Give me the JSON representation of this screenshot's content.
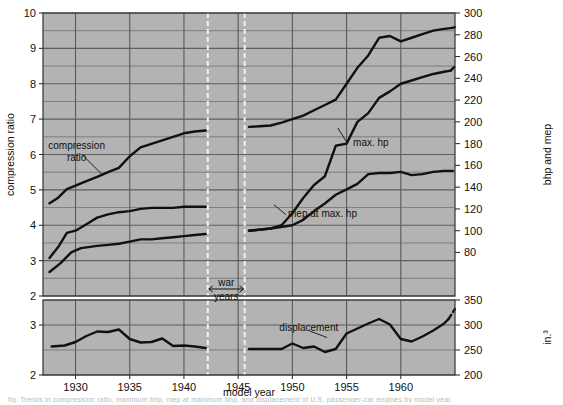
{
  "figure": {
    "background": "#ffffff",
    "panel_fill": "#b3b3b3",
    "grid_color": "#5a5a5a",
    "curve_color": "#111111",
    "war_marker_color": "#f2f2f2",
    "xlabel": "model year",
    "caption": "fig.  Trends in compression ratio, maximum bhp, mep at maximum bhp, and displacement of U.S. passenger-car engines by model year."
  },
  "chart_data": {
    "type": "line",
    "title": "",
    "xlabel": "model year",
    "xlim": [
      1927,
      1965
    ],
    "xticks": [
      1930,
      1935,
      1940,
      1945,
      1950,
      1955,
      1960
    ],
    "grid": true,
    "legend": "inline-annotations",
    "panels": [
      {
        "name": "upper",
        "ylabel_left": "compression ratio",
        "ylabel_right": "bhp and mep",
        "ylim_left": [
          2,
          10
        ],
        "yticks_left": [
          2,
          3,
          4,
          5,
          6,
          7,
          8,
          9,
          10
        ],
        "minor_step_left": 0.5,
        "ylim_right": [
          40,
          300
        ],
        "yticks_right": [
          80,
          100,
          120,
          140,
          160,
          180,
          200,
          220,
          240,
          260,
          280,
          300
        ],
        "series": [
          {
            "name": "compression ratio",
            "axis": "left",
            "label": "compression ratio",
            "segments": [
              {
                "dashed": false,
                "points": [
                  [
                    1927.6,
                    4.62
                  ],
                  [
                    1928.4,
                    4.78
                  ],
                  [
                    1929.2,
                    5.02
                  ],
                  [
                    1930.0,
                    5.12
                  ],
                  [
                    1931.0,
                    5.25
                  ],
                  [
                    1932.0,
                    5.37
                  ],
                  [
                    1933.0,
                    5.5
                  ],
                  [
                    1934.0,
                    5.62
                  ],
                  [
                    1935.0,
                    5.95
                  ],
                  [
                    1936.0,
                    6.2
                  ],
                  [
                    1937.0,
                    6.3
                  ],
                  [
                    1938.0,
                    6.4
                  ],
                  [
                    1939.0,
                    6.5
                  ],
                  [
                    1940.0,
                    6.6
                  ],
                  [
                    1941.0,
                    6.65
                  ],
                  [
                    1942.0,
                    6.68
                  ]
                ]
              },
              {
                "dashed": false,
                "points": [
                  [
                    1946.0,
                    6.78
                  ],
                  [
                    1947.0,
                    6.8
                  ],
                  [
                    1948.0,
                    6.82
                  ],
                  [
                    1949.0,
                    6.9
                  ],
                  [
                    1950.0,
                    7.0
                  ],
                  [
                    1951.0,
                    7.1
                  ],
                  [
                    1952.0,
                    7.25
                  ],
                  [
                    1953.0,
                    7.4
                  ],
                  [
                    1954.0,
                    7.55
                  ],
                  [
                    1955.0,
                    8.0
                  ],
                  [
                    1956.0,
                    8.45
                  ],
                  [
                    1957.0,
                    8.8
                  ],
                  [
                    1958.0,
                    9.3
                  ],
                  [
                    1959.0,
                    9.35
                  ],
                  [
                    1960.0,
                    9.2
                  ],
                  [
                    1961.0,
                    9.3
                  ],
                  [
                    1962.0,
                    9.4
                  ],
                  [
                    1963.0,
                    9.5
                  ],
                  [
                    1964.0,
                    9.55
                  ],
                  [
                    1964.8,
                    9.58
                  ]
                ]
              },
              {
                "dashed": true,
                "points": [
                  [
                    1964.8,
                    9.58
                  ],
                  [
                    1965.0,
                    9.6
                  ]
                ]
              }
            ]
          },
          {
            "name": "max. hp",
            "axis": "right",
            "label": "max. hp",
            "segments": [
              {
                "dashed": false,
                "points": [
                  [
                    1927.6,
                    75
                  ],
                  [
                    1928.4,
                    85
                  ],
                  [
                    1929.2,
                    98
                  ],
                  [
                    1930.0,
                    100
                  ],
                  [
                    1931.0,
                    106
                  ],
                  [
                    1932.0,
                    112
                  ],
                  [
                    1933.0,
                    115
                  ],
                  [
                    1934.0,
                    117
                  ],
                  [
                    1935.0,
                    118
                  ],
                  [
                    1936.0,
                    120
                  ],
                  [
                    1937.0,
                    121
                  ],
                  [
                    1938.0,
                    121
                  ],
                  [
                    1939.0,
                    121
                  ],
                  [
                    1940.0,
                    122
                  ],
                  [
                    1941.0,
                    122
                  ],
                  [
                    1942.0,
                    122
                  ]
                ]
              },
              {
                "dashed": false,
                "points": [
                  [
                    1946.0,
                    100
                  ],
                  [
                    1947.0,
                    101
                  ],
                  [
                    1948.0,
                    102
                  ],
                  [
                    1949.0,
                    105
                  ],
                  [
                    1950.0,
                    116
                  ],
                  [
                    1951.0,
                    130
                  ],
                  [
                    1952.0,
                    142
                  ],
                  [
                    1953.0,
                    150
                  ],
                  [
                    1954.0,
                    178
                  ],
                  [
                    1955.0,
                    180
                  ],
                  [
                    1956.0,
                    200
                  ],
                  [
                    1957.0,
                    208
                  ],
                  [
                    1958.0,
                    222
                  ],
                  [
                    1959.0,
                    228
                  ],
                  [
                    1960.0,
                    235
                  ],
                  [
                    1961.0,
                    238
                  ],
                  [
                    1962.0,
                    241
                  ],
                  [
                    1963.0,
                    244
                  ],
                  [
                    1964.0,
                    246
                  ],
                  [
                    1964.6,
                    247
                  ]
                ]
              },
              {
                "dashed": true,
                "points": [
                  [
                    1964.6,
                    247
                  ],
                  [
                    1965.0,
                    251
                  ]
                ]
              }
            ]
          },
          {
            "name": "mep at max. hp",
            "axis": "right",
            "label": "mep at max. hp",
            "segments": [
              {
                "dashed": false,
                "points": [
                  [
                    1927.6,
                    62
                  ],
                  [
                    1928.6,
                    70
                  ],
                  [
                    1929.6,
                    80
                  ],
                  [
                    1930.5,
                    84
                  ],
                  [
                    1932.0,
                    86
                  ],
                  [
                    1933.0,
                    87
                  ],
                  [
                    1934.0,
                    88
                  ],
                  [
                    1935.0,
                    90
                  ],
                  [
                    1936.0,
                    92
                  ],
                  [
                    1937.0,
                    92
                  ],
                  [
                    1938.0,
                    93
                  ],
                  [
                    1939.0,
                    94
                  ],
                  [
                    1940.0,
                    95
                  ],
                  [
                    1941.0,
                    96
                  ],
                  [
                    1942.0,
                    97
                  ]
                ]
              },
              {
                "dashed": false,
                "points": [
                  [
                    1946.0,
                    100
                  ],
                  [
                    1948.0,
                    102
                  ],
                  [
                    1950.0,
                    105
                  ],
                  [
                    1951.0,
                    110
                  ],
                  [
                    1952.0,
                    118
                  ],
                  [
                    1953.0,
                    125
                  ],
                  [
                    1954.0,
                    133
                  ],
                  [
                    1955.0,
                    138
                  ],
                  [
                    1956.0,
                    143
                  ],
                  [
                    1957.0,
                    152
                  ],
                  [
                    1958.0,
                    153
                  ],
                  [
                    1959.0,
                    153
                  ],
                  [
                    1960.0,
                    154
                  ],
                  [
                    1961.0,
                    151
                  ],
                  [
                    1962.0,
                    152
                  ],
                  [
                    1963.0,
                    154
                  ],
                  [
                    1964.0,
                    155
                  ],
                  [
                    1964.8,
                    155
                  ]
                ]
              }
            ]
          }
        ],
        "annotations": [
          {
            "text": "compression ratio",
            "x": 1930.1,
            "y": 6.15,
            "lines": [
              "compression",
              "ratio"
            ]
          },
          {
            "text": "max. hp",
            "x": 1955.6,
            "y": 6.25,
            "lines": [
              "max. hp"
            ]
          },
          {
            "text": "mep at max. hp",
            "x": 1949.6,
            "y": 4.23,
            "lines": [
              "mep at max. hp"
            ]
          }
        ]
      },
      {
        "name": "lower",
        "ylabel_left": "",
        "ylabel_right": "in.³",
        "ylim_left": [
          2,
          3.5
        ],
        "yticks_left": [
          2,
          3
        ],
        "minor_step_left": 0.5,
        "ylim_right": [
          200,
          350
        ],
        "yticks_right": [
          200,
          250,
          300,
          350
        ],
        "series": [
          {
            "name": "displacement",
            "axis": "right",
            "label": "displacement",
            "segments": [
              {
                "dashed": false,
                "points": [
                  [
                    1927.8,
                    257
                  ],
                  [
                    1929.0,
                    259
                  ],
                  [
                    1930.0,
                    266
                  ],
                  [
                    1931.0,
                    278
                  ],
                  [
                    1932.0,
                    287
                  ],
                  [
                    1933.0,
                    286
                  ],
                  [
                    1934.0,
                    291
                  ],
                  [
                    1935.0,
                    272
                  ],
                  [
                    1936.0,
                    265
                  ],
                  [
                    1937.0,
                    266
                  ],
                  [
                    1938.0,
                    273
                  ],
                  [
                    1939.0,
                    258
                  ],
                  [
                    1940.0,
                    259
                  ],
                  [
                    1941.0,
                    257
                  ],
                  [
                    1942.0,
                    254
                  ]
                ]
              },
              {
                "dashed": false,
                "points": [
                  [
                    1946.0,
                    252
                  ],
                  [
                    1948.0,
                    252
                  ],
                  [
                    1949.0,
                    252
                  ],
                  [
                    1950.0,
                    263
                  ],
                  [
                    1951.0,
                    254
                  ],
                  [
                    1952.0,
                    257
                  ],
                  [
                    1953.0,
                    246
                  ],
                  [
                    1954.0,
                    252
                  ],
                  [
                    1955.0,
                    283
                  ],
                  [
                    1956.0,
                    293
                  ],
                  [
                    1957.0,
                    303
                  ],
                  [
                    1958.0,
                    312
                  ],
                  [
                    1959.0,
                    301
                  ],
                  [
                    1960.0,
                    272
                  ],
                  [
                    1961.0,
                    267
                  ],
                  [
                    1962.0,
                    277
                  ],
                  [
                    1963.0,
                    289
                  ],
                  [
                    1964.0,
                    303
                  ],
                  [
                    1964.4,
                    312
                  ]
                ]
              },
              {
                "dashed": true,
                "points": [
                  [
                    1964.4,
                    312
                  ],
                  [
                    1965.0,
                    332
                  ]
                ]
              }
            ]
          }
        ],
        "annotations": [
          {
            "text": "displacement",
            "x": 1948.8,
            "y": 288,
            "lines": [
              "displacement"
            ]
          }
        ]
      }
    ],
    "war_years": {
      "label_lines": [
        "war",
        "years"
      ],
      "start": 1942.2,
      "end": 1945.6
    }
  }
}
